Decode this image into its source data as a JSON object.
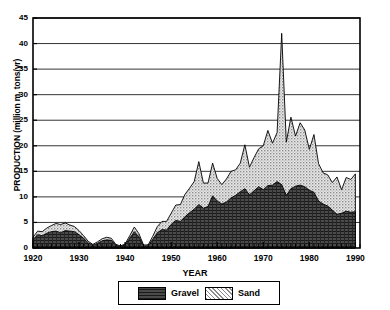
{
  "chart_data": {
    "type": "area",
    "title": "",
    "xlabel": "YEAR",
    "ylabel": "PRODUCTION (million m. tons/yr)",
    "xlim": [
      1920,
      1991
    ],
    "ylim": [
      0,
      45
    ],
    "ytick_values": [
      0,
      5,
      10,
      15,
      20,
      25,
      30,
      35,
      40,
      45
    ],
    "ytick_labels": [
      "0",
      "5",
      "10",
      "15",
      "20",
      "25",
      "30",
      "35",
      "40",
      "45"
    ],
    "xtick_values": [
      1920,
      1930,
      1940,
      1950,
      1960,
      1970,
      1980,
      1990
    ],
    "xtick_labels": [
      "1920",
      "1930",
      "1940",
      "1950",
      "1960",
      "1970",
      "1980",
      "1990"
    ],
    "minor_xtick_interval": 1,
    "grid": "horizontal",
    "stacked": true,
    "legend_position": "below-axes",
    "legend": [
      "Gravel",
      "Sand"
    ],
    "colors": {
      "gravel": "#3a3a3a",
      "sand": "#d0d0d0",
      "axis": "#000000",
      "grid": "#000000"
    },
    "x": [
      1920,
      1921,
      1922,
      1923,
      1924,
      1925,
      1926,
      1927,
      1928,
      1929,
      1930,
      1931,
      1932,
      1933,
      1934,
      1935,
      1936,
      1937,
      1938,
      1939,
      1940,
      1941,
      1942,
      1943,
      1944,
      1945,
      1946,
      1947,
      1948,
      1949,
      1950,
      1951,
      1952,
      1953,
      1954,
      1955,
      1956,
      1957,
      1958,
      1959,
      1960,
      1961,
      1962,
      1963,
      1964,
      1965,
      1966,
      1967,
      1968,
      1969,
      1970,
      1971,
      1972,
      1973,
      1974,
      1975,
      1976,
      1977,
      1978,
      1979,
      1980,
      1981,
      1982,
      1983,
      1984,
      1985,
      1986,
      1987,
      1988,
      1989,
      1990
    ],
    "series": [
      {
        "name": "Gravel",
        "values": [
          1.6,
          2.6,
          2.4,
          2.9,
          3.2,
          3.3,
          3.0,
          3.4,
          3.3,
          3.2,
          2.6,
          1.9,
          1.0,
          0.5,
          0.9,
          1.4,
          1.6,
          1.5,
          0.5,
          0.3,
          0.6,
          1.9,
          3.2,
          2.2,
          0.4,
          0.4,
          1.7,
          3.0,
          3.6,
          3.5,
          4.6,
          5.4,
          5.2,
          6.1,
          6.9,
          7.6,
          8.5,
          7.8,
          8.1,
          10.2,
          9.2,
          8.6,
          9.0,
          9.8,
          10.3,
          11.0,
          11.6,
          10.4,
          11.2,
          12.0,
          11.4,
          12.2,
          12.3,
          13.0,
          12.4,
          10.3,
          11.6,
          12.1,
          12.3,
          12.0,
          11.3,
          10.9,
          9.2,
          8.6,
          8.2,
          7.4,
          6.6,
          6.8,
          7.2,
          7.0,
          7.1
        ]
      },
      {
        "name": "Sand",
        "values": [
          0.5,
          0.7,
          0.8,
          1.0,
          1.2,
          1.5,
          1.6,
          1.5,
          1.2,
          1.0,
          0.8,
          0.5,
          0.3,
          0.2,
          0.3,
          0.4,
          0.5,
          0.4,
          0.2,
          0.1,
          0.2,
          0.5,
          0.9,
          0.6,
          0.2,
          0.2,
          0.6,
          1.2,
          1.6,
          1.7,
          2.2,
          3.0,
          3.3,
          4.4,
          4.8,
          5.4,
          8.4,
          4.9,
          4.6,
          6.4,
          4.4,
          3.8,
          4.5,
          5.2,
          5.0,
          5.6,
          8.6,
          5.4,
          6.5,
          7.4,
          8.6,
          10.8,
          8.2,
          9.6,
          29.6,
          10.4,
          14.0,
          9.8,
          12.2,
          11.1,
          8.0,
          11.3,
          7.3,
          6.1,
          6.1,
          5.4,
          7.3,
          4.6,
          6.6,
          6.4,
          7.4
        ]
      }
    ],
    "total_peak": {
      "year": 1974,
      "value": 42.0
    }
  },
  "legend": {
    "gravel_label": "Gravel",
    "sand_label": "Sand"
  }
}
